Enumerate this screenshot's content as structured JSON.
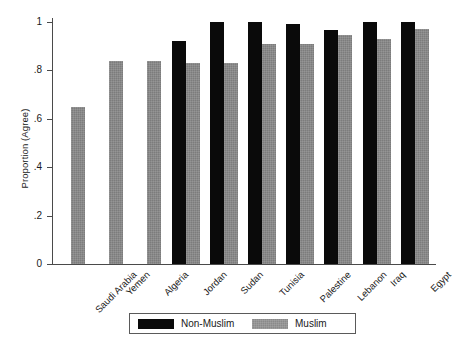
{
  "chart_data": {
    "type": "bar",
    "title": "",
    "subtitle": "",
    "xlabel": "",
    "ylabel": "Proportion (Agree)",
    "ylim": [
      0,
      1
    ],
    "ytick_labels": [
      "0",
      ".2",
      ".4",
      ".6",
      ".8",
      "1"
    ],
    "ytick_values": [
      0,
      0.2,
      0.4,
      0.6,
      0.8,
      1
    ],
    "grid": false,
    "legend_position": "bottom",
    "categories": [
      "Saudi Arabia",
      "Yemen",
      "Algeria",
      "Jordan",
      "Sudan",
      "Tunisia",
      "Palestine",
      "Lebanon",
      "Iraq",
      "Egypt"
    ],
    "series": [
      {
        "name": "Non-Muslim",
        "color": "#0a0a0a",
        "values": [
          null,
          null,
          null,
          0.92,
          1.0,
          1.0,
          0.99,
          0.965,
          1.0,
          1.0
        ]
      },
      {
        "name": "Muslim",
        "color": "#7c7c7c",
        "values": [
          0.65,
          0.84,
          0.84,
          0.83,
          0.83,
          0.91,
          0.91,
          0.945,
          0.93,
          0.97
        ]
      }
    ]
  },
  "legend": {
    "entries": [
      {
        "label": "Non-Muslim",
        "swatch": "nonmuslim"
      },
      {
        "label": "Muslim",
        "swatch": "muslim"
      }
    ]
  }
}
